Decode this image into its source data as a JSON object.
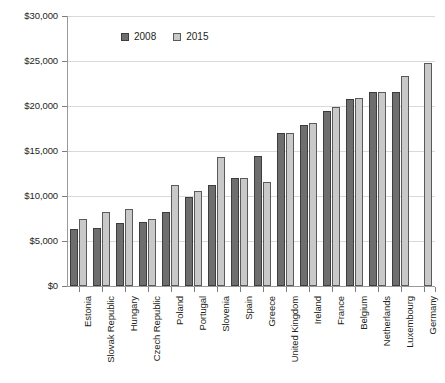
{
  "chart_data": {
    "type": "bar",
    "title": "",
    "subtitle": "",
    "xlabel": "",
    "ylabel": "",
    "ylim": [
      0,
      30000
    ],
    "ytick_values": [
      0,
      5000,
      10000,
      15000,
      20000,
      25000,
      30000
    ],
    "ytick_labels": [
      "$0",
      "$5,000",
      "$10,000",
      "$15,000",
      "$20,000",
      "$25,000",
      "$30,000"
    ],
    "grid": true,
    "legend_position": "top-left-inside",
    "categories": [
      "Estonia",
      "Slovak Republic",
      "Hungary",
      "Czech Republic",
      "Poland",
      "Portugal",
      "Slovenia",
      "Spain",
      "Greece",
      "United Kingdom",
      "Ireland",
      "France",
      "Belgium",
      "Netherlands",
      "Luxembourg",
      "Germany"
    ],
    "series": [
      {
        "name": "2008",
        "color": "#6e6e6e",
        "values": [
          6300,
          6500,
          7000,
          7100,
          8200,
          9900,
          11200,
          12000,
          14500,
          17000,
          17900,
          19500,
          20800,
          21600,
          21600,
          null
        ]
      },
      {
        "name": "2015",
        "color": "#c9c9c9",
        "values": [
          7500,
          8200,
          8600,
          7500,
          11200,
          10600,
          14300,
          12000,
          11600,
          17000,
          18100,
          19900,
          20900,
          21600,
          23300,
          24800
        ]
      }
    ]
  },
  "legend": {
    "items": [
      {
        "label": "2008",
        "swatch_class": "s2008"
      },
      {
        "label": "2015",
        "swatch_class": "s2015"
      }
    ]
  }
}
